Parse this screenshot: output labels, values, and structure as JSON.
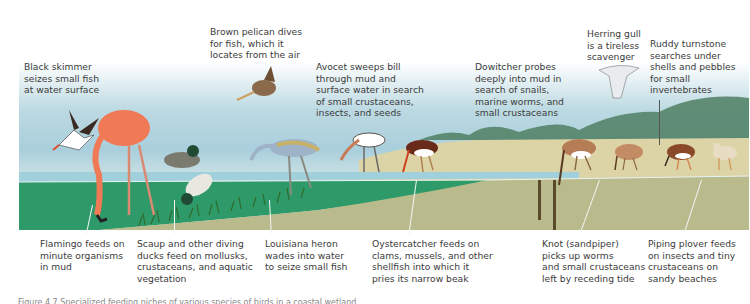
{
  "figure": {
    "caption_visible": "Figure 4.7 (clipped)",
    "colors": {
      "sky_top": "#ffffff",
      "sky_blue": "#a9cfdc",
      "water_green": "#2e9a6a",
      "water_blue": "#7fc1d2",
      "mud": "#b9bb8c",
      "sand": "#dcd4a6",
      "hills": "#4f7f63"
    }
  },
  "labels": {
    "black_skimmer": "Black skimmer\nseizes small fish\nat water surface",
    "brown_pelican": "Brown pelican dives\nfor fish, which it\nlocates from the air",
    "avocet": "Avocet sweeps bill\nthrough mud and\nsurface water in search\nof small crustaceans,\ninsects, and seeds",
    "dowitcher": "Dowitcher probes\ndeeply into mud in\nsearch of snails,\nmarine worms, and\nsmall crustaceans",
    "herring_gull": "Herring gull\nis a tireless\nscavenger",
    "ruddy_turnstone": "Ruddy turnstone\nsearches under\nshells and pebbles\nfor small\ninvertebrates",
    "flamingo": "Flamingo feeds on\nminute organisms\nin mud",
    "scaup": "Scaup and other diving\nducks feed on mollusks,\ncrustaceans, and aquatic\nvegetation",
    "louisiana_heron": "Louisiana heron\nwades into water\nto seize small fish",
    "oystercatcher": "Oystercatcher feeds on\nclams, mussels, and other\nshellfish into which it\npries its narrow beak",
    "knot": "Knot (sandpiper)\npicks up worms\nand small crustaceans\nleft by receding tide",
    "piping_plover": "Piping plover feeds\non insects and tiny\ncrustaceans on\nsandy beaches"
  },
  "caption": "Figure 4.7 Specialized feeding niches of various species of birds in a coastal wetland"
}
